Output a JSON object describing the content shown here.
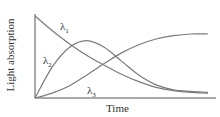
{
  "chart_data": {
    "type": "line",
    "title": "",
    "xlabel": "Time",
    "ylabel": "Light absorption",
    "grid": false,
    "legend": "inline labels",
    "axis_ticks": "none",
    "x": [
      0,
      0.1,
      0.2,
      0.3,
      0.4,
      0.5,
      0.6,
      0.7,
      0.8,
      0.9,
      1.0
    ],
    "series": [
      {
        "name": "λ1",
        "label_main": "λ",
        "label_sub": "1",
        "values": [
          1.0,
          0.82,
          0.66,
          0.52,
          0.4,
          0.29,
          0.2,
          0.13,
          0.09,
          0.07,
          0.06
        ]
      },
      {
        "name": "λ2",
        "label_main": "λ",
        "label_sub": "2",
        "values": [
          0.0,
          0.38,
          0.62,
          0.7,
          0.62,
          0.45,
          0.28,
          0.16,
          0.1,
          0.08,
          0.07
        ]
      },
      {
        "name": "λ3",
        "label_main": "λ",
        "label_sub": "3",
        "values": [
          0.0,
          0.06,
          0.15,
          0.28,
          0.42,
          0.55,
          0.65,
          0.72,
          0.76,
          0.78,
          0.78
        ]
      }
    ],
    "ylim": [
      0,
      1
    ],
    "xlim": [
      0,
      1
    ],
    "line_color": "#7a7a7a"
  }
}
